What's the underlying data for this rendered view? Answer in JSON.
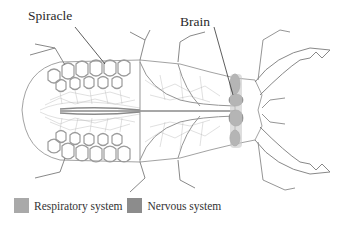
{
  "diagram": {
    "labels": [
      {
        "id": "spiracle",
        "text": "Spiracle"
      },
      {
        "id": "brain",
        "text": "Brain"
      }
    ]
  },
  "legend": {
    "items": [
      {
        "label": "Respiratory system",
        "color": "#a9a9a9"
      },
      {
        "label": "Nervous system",
        "color": "#8c8c8c"
      }
    ]
  },
  "colors": {
    "outline": "#7a7a7a",
    "trachea": "#9a9a9a",
    "nerve": "#8a8a8a",
    "background": "#ffffff"
  }
}
